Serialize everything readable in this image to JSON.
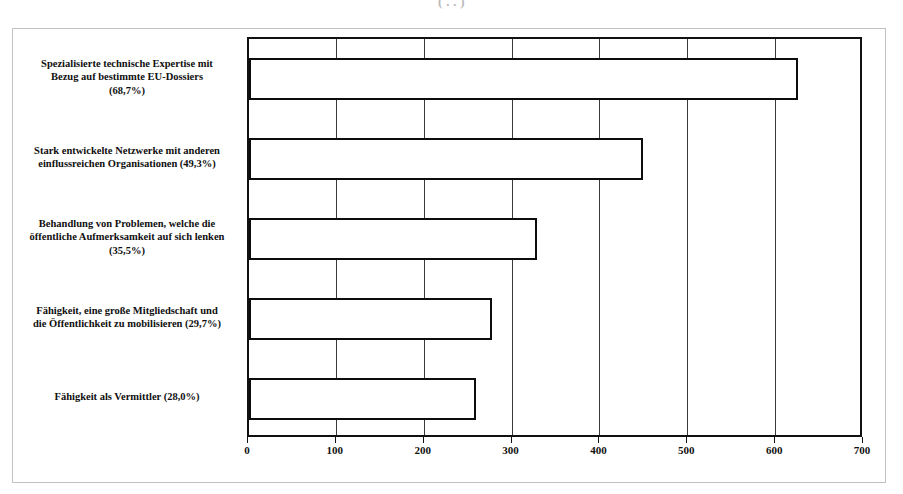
{
  "scan": {
    "title_fragment": "(  .  .   )"
  },
  "chart_data": {
    "type": "bar",
    "orientation": "horizontal",
    "title": "",
    "subtitle": "",
    "xlabel": "",
    "ylabel": "",
    "xlim": [
      0,
      700
    ],
    "xticks": [
      0,
      100,
      200,
      300,
      400,
      500,
      600,
      700
    ],
    "xtick_labels": [
      "0",
      "100",
      "200",
      "300",
      "400",
      "500",
      "600",
      "700"
    ],
    "grid": true,
    "grid_axis": "x",
    "legend": false,
    "legend_position": "none",
    "bar_fill_color": "#ffffff",
    "bar_edge_color": "#0d0d0d",
    "categories": [
      "Spezialisierte technische Expertise mit\nBezug auf bestimmte EU-Dossiers\n(68,7%)",
      "Stark entwickelte Netzwerke mit anderen\neinflussreichen Organisationen (49,3%)",
      "Behandlung von Problemen, welche die\nöffentliche Aufmerksamkeit auf sich lenken\n(35,5%)",
      "Fähigkeit, eine große Mitgliedschaft und\ndie Öffentlichkeit zu mobilisieren (29,7%)",
      "Fähigkeit als Vermittler (28,0%)"
    ],
    "percent_labels": [
      "68,7%",
      "49,3%",
      "35,5%",
      "29,7%",
      "28,0%"
    ],
    "values": [
      625,
      448,
      328,
      277,
      258
    ]
  }
}
